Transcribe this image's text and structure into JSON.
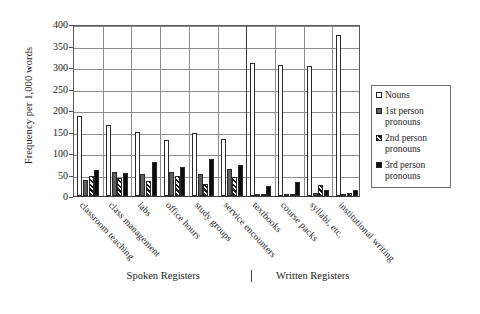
{
  "chart_data": {
    "type": "bar",
    "title": "",
    "xlabel": "",
    "ylabel": "Frequency per 1,000 words",
    "ylim": [
      0,
      400
    ],
    "yticks": [
      0,
      50,
      100,
      150,
      200,
      250,
      300,
      350,
      400
    ],
    "grid": true,
    "legend_position": "right",
    "categories": [
      "classroom teaching",
      "class management",
      "labs",
      "office hours",
      "study groups",
      "service encounters",
      "textbooks",
      "course packs",
      "syllabi, etc.",
      "institutional writing"
    ],
    "group_labels": [
      {
        "label": "Spoken Registers",
        "categories": 6
      },
      {
        "label": "Written Registers",
        "categories": 4
      }
    ],
    "series": [
      {
        "name": "Nouns",
        "swatch": "open-white",
        "values": [
          187,
          165,
          148,
          131,
          147,
          133,
          309,
          304,
          302,
          375
        ]
      },
      {
        "name": "1st person pronouns",
        "swatch": "dark-gray",
        "values": [
          38,
          55,
          51,
          57,
          51,
          63,
          4,
          5,
          8,
          3
        ]
      },
      {
        "name": "2nd person pronouns",
        "swatch": "hatched",
        "values": [
          47,
          43,
          36,
          46,
          28,
          45,
          1,
          2,
          26,
          7
        ]
      },
      {
        "name": "3rd person pronouns",
        "swatch": "solid-black",
        "values": [
          60,
          53,
          79,
          67,
          85,
          72,
          24,
          32,
          15,
          13
        ]
      }
    ]
  },
  "legend": {
    "items": [
      {
        "label": "Nouns"
      },
      {
        "label": "1st person pronouns"
      },
      {
        "label": "2nd person pronouns"
      },
      {
        "label": "3rd person pronouns"
      }
    ]
  }
}
